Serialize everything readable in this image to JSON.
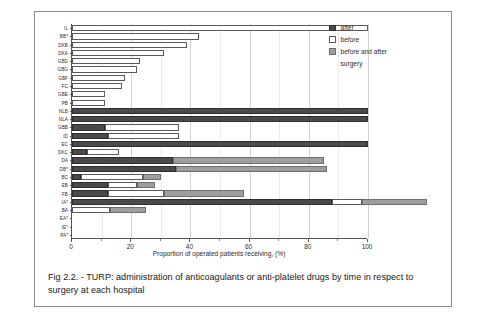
{
  "figure": {
    "caption": "Fig 2.2. - TURP: administration of  anticoagulants or anti-platelet drugs by time in respect to surgery at each hospital"
  },
  "legend": {
    "items": [
      {
        "label": "after",
        "key": "after",
        "color": "#4a4a4a"
      },
      {
        "label": "before",
        "key": "before",
        "color": "#ffffff"
      },
      {
        "label": "before and after",
        "key": "both",
        "color": "#9e9e9e"
      }
    ],
    "continuation": "surgery"
  },
  "chart_data": {
    "type": "bar",
    "orientation": "horizontal",
    "stacked": true,
    "title": "",
    "xlabel": "Proportion of operated patients receiving, (%)",
    "ylabel": "",
    "xlim": [
      0,
      100
    ],
    "xticks": [
      0,
      20,
      40,
      60,
      80,
      100
    ],
    "xticks_minor": [
      10,
      30,
      50,
      70,
      90
    ],
    "grid": "vertical",
    "legend_position": "top-right",
    "categories": [
      "IL",
      "BB*",
      "DKB",
      "DKA",
      "GBD",
      "GBG",
      "GBF",
      "FC",
      "GBE",
      "PB",
      "NLB",
      "NLA",
      "GBB",
      "ID",
      "EC",
      "DKC",
      "DA",
      "DB*",
      "BC",
      "EB",
      "FB",
      "IA*",
      "BA",
      "EA*",
      "IE*",
      "PA*"
    ],
    "series": [
      {
        "name": "after",
        "key": "after",
        "color": "#4a4a4a",
        "values": [
          0,
          0,
          0,
          0,
          0,
          0,
          0,
          0,
          0,
          0,
          100,
          100,
          11,
          12,
          100,
          5,
          34,
          35,
          3,
          12,
          12,
          88,
          0,
          0,
          0,
          0
        ]
      },
      {
        "name": "before",
        "key": "before",
        "color": "#ffffff",
        "values": [
          100,
          43,
          39,
          31,
          23,
          22,
          18,
          17,
          11,
          11,
          0,
          0,
          25,
          24,
          0,
          11,
          0,
          0,
          21,
          10,
          19,
          10,
          13,
          0,
          0,
          0
        ]
      },
      {
        "name": "before and after",
        "key": "both",
        "color": "#9e9e9e",
        "values": [
          0,
          0,
          0,
          0,
          0,
          0,
          0,
          0,
          0,
          0,
          0,
          0,
          0,
          0,
          0,
          0,
          51,
          51,
          6,
          6,
          27,
          22,
          12,
          0,
          0,
          0
        ]
      }
    ],
    "totals": [
      100,
      43,
      39,
      31,
      23,
      22,
      18,
      17,
      11,
      11,
      100,
      100,
      36,
      36,
      100,
      16,
      85,
      86,
      30,
      28,
      58,
      120,
      25,
      0,
      0,
      0
    ],
    "note_star_categories": [
      "BB*",
      "DB*",
      "IA*",
      "EA*",
      "IE*",
      "PA*"
    ]
  }
}
